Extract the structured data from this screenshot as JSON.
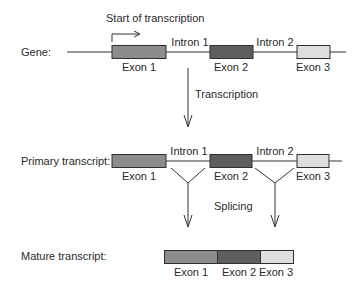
{
  "gene": {
    "label": "Gene:",
    "start_label": "Start of transcription",
    "exons": [
      {
        "label": "Exon 1",
        "color": "#8c8c8c"
      },
      {
        "label": "Exon 2",
        "color": "#5e5e5e"
      },
      {
        "label": "Exon 3",
        "color": "#dedede"
      }
    ],
    "introns": [
      {
        "label": "Intron 1"
      },
      {
        "label": "Intron 2"
      }
    ]
  },
  "transcription": {
    "label": "Transcription"
  },
  "primary": {
    "label": "Primary transcript:",
    "exons": [
      {
        "label": "Exon 1"
      },
      {
        "label": "Exon 2"
      },
      {
        "label": "Exon 3"
      }
    ],
    "introns": [
      {
        "label": "Intron 1"
      },
      {
        "label": "Intron 2"
      }
    ]
  },
  "splicing": {
    "label": "Splicing"
  },
  "mature": {
    "label": "Mature transcript:",
    "exons": [
      {
        "label": "Exon 1"
      },
      {
        "label": "Exon 2"
      },
      {
        "label": "Exon 3"
      }
    ]
  },
  "colors": {
    "line": "#333333",
    "exon1": "#8c8c8c",
    "exon2": "#5e5e5e",
    "exon3": "#dedede",
    "border": "#2e2e2e"
  }
}
